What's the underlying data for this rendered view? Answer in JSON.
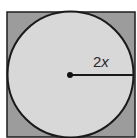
{
  "figure": {
    "type": "circle-inscribed-in-square",
    "square": {
      "x": 7,
      "y": 12,
      "width": 128,
      "height": 125,
      "fill": "#9c9c9c",
      "stroke": "#1e1e1e"
    },
    "circle": {
      "cx": 70.5,
      "cy": 74.5,
      "r": 63,
      "fill": "#d8d8d8",
      "stroke": "#1a1a1a"
    },
    "center_point": {
      "cx": 70,
      "cy": 75,
      "r": 3,
      "fill": "#111111"
    },
    "radius_line": {
      "x1": 70,
      "y1": 75,
      "x2": 134,
      "y2": 75
    },
    "radius_label": {
      "coefficient": "2",
      "variable": "x",
      "x": 93,
      "y": 67
    }
  }
}
